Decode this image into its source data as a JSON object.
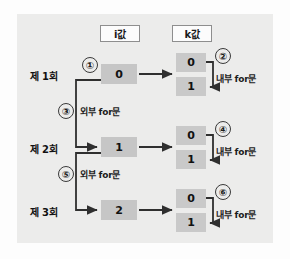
{
  "diagram": {
    "title_columns": [
      {
        "key": "i",
        "label": "i값"
      },
      {
        "key": "k",
        "label": "k값"
      }
    ],
    "rows": [
      {
        "row_label": "제 1회",
        "i_value": "0",
        "k_values": [
          "0",
          "1"
        ],
        "outer_marker": "①",
        "inner_marker": "②",
        "inner_caption": "내부 for문",
        "outer_caption": "외부 for문",
        "outer_caption_marker": "③"
      },
      {
        "row_label": "제 2회",
        "i_value": "1",
        "k_values": [
          "0",
          "1"
        ],
        "outer_marker": "③",
        "inner_marker": "④",
        "inner_caption": "내부 for문",
        "outer_caption": "외부 for문",
        "outer_caption_marker": "⑤"
      },
      {
        "row_label": "제 3회",
        "i_value": "2",
        "k_values": [
          "0",
          "1"
        ],
        "outer_marker": "⑤",
        "inner_marker": "⑥",
        "inner_caption": "내부 for문",
        "outer_caption": "",
        "outer_caption_marker": ""
      }
    ],
    "markers": {
      "m1": "①",
      "m2": "②",
      "m3": "③",
      "m4": "④",
      "m5": "⑤",
      "m6": "⑥"
    },
    "captions": {
      "outer_loop_1": "외부 for문",
      "outer_loop_2": "외부 for문",
      "inner_loop_1": "내부 for문",
      "inner_loop_2": "내부 for문",
      "inner_loop_3": "내부 for문"
    },
    "colors": {
      "panel_background": "#ececeb",
      "cell_fill": "#c6c6c6",
      "header_fill": "#fcfcfc",
      "stroke": "#2f2f2f",
      "page_background": "#fdfdfd"
    }
  }
}
